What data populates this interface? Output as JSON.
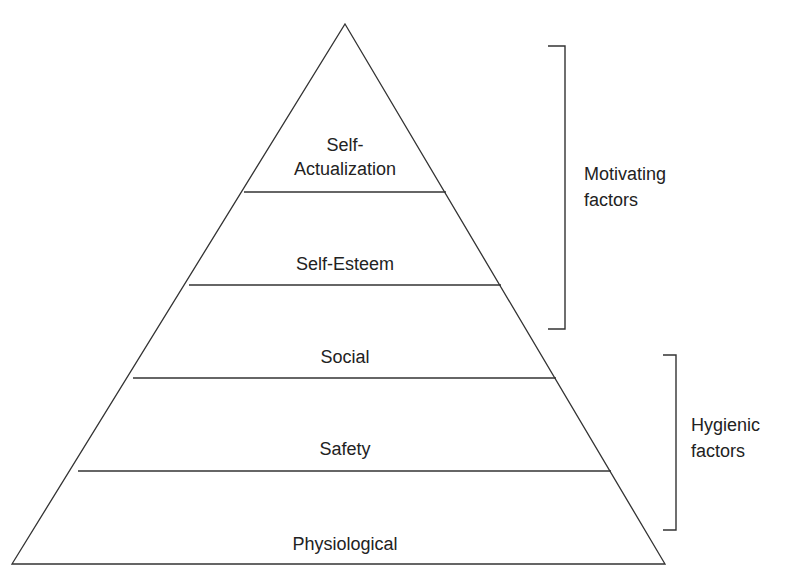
{
  "diagram": {
    "type": "pyramid",
    "levels": [
      {
        "id": "self-actualization",
        "line1": "Self-",
        "line2": "Actualization"
      },
      {
        "id": "self-esteem",
        "label": "Self-Esteem"
      },
      {
        "id": "social",
        "label": "Social"
      },
      {
        "id": "safety",
        "label": "Safety"
      },
      {
        "id": "physiological",
        "label": "Physiological"
      }
    ],
    "groups": [
      {
        "id": "motivating",
        "line1": "Motivating",
        "line2": "factors",
        "spans": [
          "self-actualization",
          "self-esteem"
        ]
      },
      {
        "id": "hygienic",
        "line1": "Hygienic",
        "line2": "factors",
        "spans": [
          "social",
          "safety",
          "physiological"
        ]
      }
    ],
    "colors": {
      "line": "#333333",
      "text": "#222222",
      "background": "#ffffff"
    }
  }
}
